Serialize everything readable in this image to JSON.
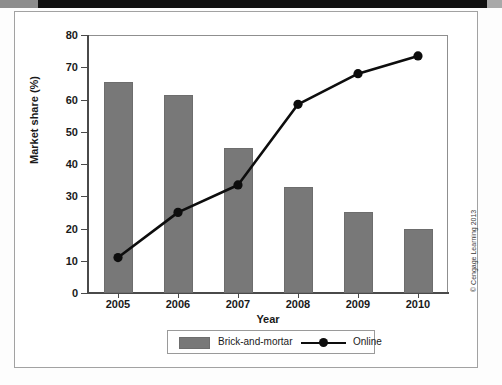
{
  "figure": {
    "copyright": "© Cengage Learning 2013"
  },
  "legend": {
    "position": "bottom-center",
    "entries": [
      {
        "label": "Brick-and-mortar",
        "marker": "swatch",
        "color": "#787878"
      },
      {
        "label": "Online",
        "marker": "line-dot",
        "color": "#0d0d0d"
      }
    ]
  },
  "chart_data": {
    "type": "bar",
    "title": "",
    "xlabel": "Year",
    "ylabel": "Market share (%)",
    "categories": [
      "2005",
      "2006",
      "2007",
      "2008",
      "2009",
      "2010"
    ],
    "ylim": [
      0,
      80
    ],
    "yticks": [
      0,
      10,
      20,
      30,
      40,
      50,
      60,
      70,
      80
    ],
    "grid": false,
    "series": [
      {
        "name": "Brick-and-mortar",
        "type": "bar",
        "color": "#787878",
        "values": [
          65.5,
          61.5,
          45,
          33,
          25,
          20
        ]
      },
      {
        "name": "Online",
        "type": "line",
        "color": "#0d0d0d",
        "marker": "circle",
        "values": [
          11,
          25,
          33.5,
          58.5,
          68,
          73.5
        ]
      }
    ]
  }
}
